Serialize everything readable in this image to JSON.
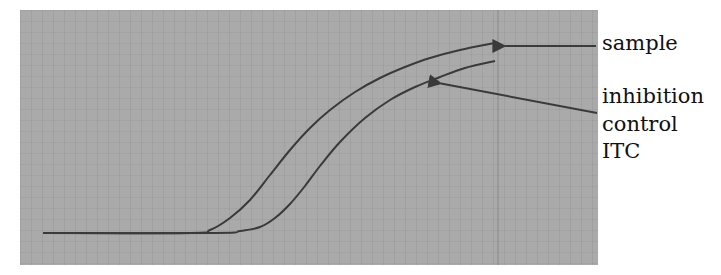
{
  "chart_data": {
    "type": "line",
    "title": "",
    "xlabel": "",
    "ylabel": "",
    "grid": true,
    "axes_ticks": "none shown",
    "series": [
      {
        "name": "sample",
        "description": "sigmoidal amplification curve, rises earlier and plateaus higher",
        "color": "#3a3a3a",
        "points_px": [
          [
            43,
            233
          ],
          [
            190,
            233
          ],
          [
            210,
            230
          ],
          [
            230,
            218
          ],
          [
            250,
            200
          ],
          [
            270,
            175
          ],
          [
            290,
            150
          ],
          [
            310,
            128
          ],
          [
            330,
            110
          ],
          [
            355,
            92
          ],
          [
            380,
            78
          ],
          [
            405,
            67
          ],
          [
            430,
            58
          ],
          [
            460,
            50
          ],
          [
            495,
            43
          ]
        ]
      },
      {
        "name": "inhibition control ITC",
        "description": "sigmoidal curve, delayed rise and lower plateau",
        "color": "#3a3a3a",
        "points_px": [
          [
            43,
            233
          ],
          [
            215,
            233
          ],
          [
            240,
            231
          ],
          [
            260,
            227
          ],
          [
            275,
            218
          ],
          [
            290,
            204
          ],
          [
            305,
            186
          ],
          [
            320,
            166
          ],
          [
            340,
            142
          ],
          [
            365,
            118
          ],
          [
            390,
            100
          ],
          [
            415,
            87
          ],
          [
            440,
            77
          ],
          [
            465,
            68
          ],
          [
            495,
            61
          ]
        ]
      }
    ],
    "annotations": [
      {
        "text": "sample",
        "arrow_from": [
          596,
          46
        ],
        "arrow_to": [
          497,
          46
        ]
      },
      {
        "text_lines": [
          "inhibition",
          "control",
          "ITC"
        ],
        "arrow_from": [
          597,
          113
        ],
        "arrow_to": [
          433,
          82
        ]
      }
    ],
    "legend_position": "right (arrow-labelled)"
  },
  "labels": {
    "sample": "sample",
    "inhibition": "inhibition",
    "control": "control",
    "itc": "ITC"
  },
  "colors": {
    "panel_background": "#aaaaaa",
    "curve": "#3a3a3a",
    "arrow": "#3a3a3a",
    "text": "#111111"
  }
}
